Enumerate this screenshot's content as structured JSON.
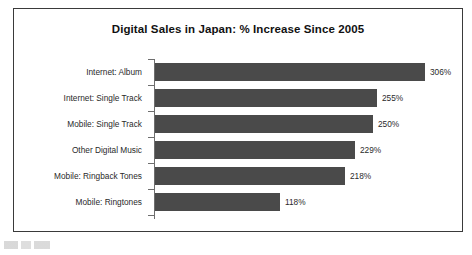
{
  "chart_data": {
    "type": "bar",
    "orientation": "horizontal",
    "title": "Digital Sales in Japan: % Increase Since 2005",
    "xlabel": "",
    "ylabel": "",
    "grid": false,
    "legend": false,
    "value_suffix": "%",
    "categories": [
      "Internet: Album",
      "Internet: Single Track",
      "Mobile: Single Track",
      "Other Digital Music",
      "Mobile: Ringback Tones",
      "Mobile: Ringtones"
    ],
    "values": [
      306,
      255,
      250,
      229,
      218,
      118
    ],
    "value_labels": [
      "306%",
      "255%",
      "250%",
      "229%",
      "218%",
      "118%"
    ],
    "bar_pixel_lengths": [
      270,
      222,
      218,
      200,
      190,
      125
    ],
    "bar_color": "#4a4a4a",
    "axis_color": "#6e6e6e",
    "frame_color": "#3a3a3a",
    "text_color": "#2a2a2a",
    "background": "#ffffff"
  }
}
